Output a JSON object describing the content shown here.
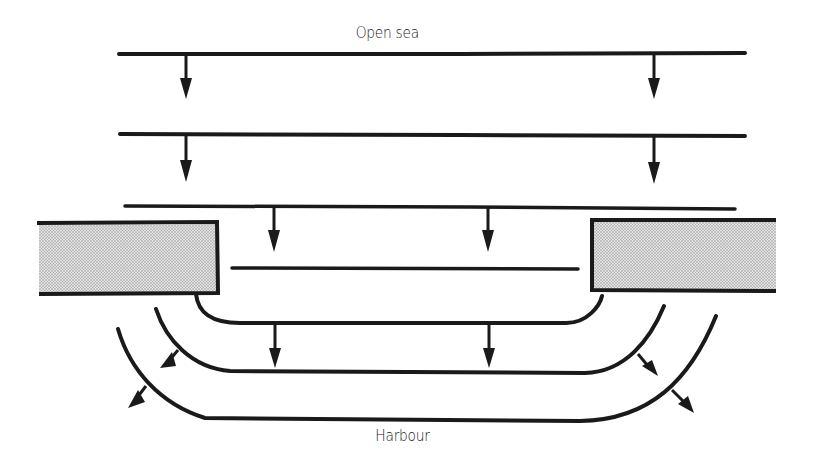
{
  "diagram": {
    "type": "wave-diffraction",
    "labels": {
      "top": "Open sea",
      "bottom": "Harbour"
    },
    "colors": {
      "line": "#1a1a1a",
      "breakwater_fill": "#c8c8c8",
      "background": "#ffffff"
    },
    "elements": {
      "wavefronts_open_sea": 3,
      "wavefront_gap": 1,
      "wavefronts_harbour_curved": 3,
      "breakwaters": 2,
      "arrows": 12
    }
  }
}
